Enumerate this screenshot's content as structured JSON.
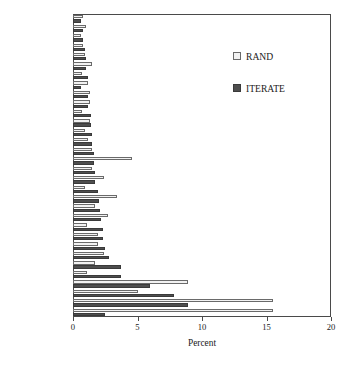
{
  "chart_data": {
    "type": "bar",
    "orientation": "horizontal",
    "title": "",
    "xlabel": "Percent",
    "ylabel": "",
    "xlim": [
      0,
      20
    ],
    "xticks": [
      0,
      5,
      10,
      15,
      20
    ],
    "xticklabels": [
      "0",
      "5",
      "10",
      "15",
      "20"
    ],
    "grid": false,
    "legend_position": "upper right",
    "categories": [
      "Peru",
      "Spain",
      "Jordan",
      "Nigeria",
      "Venezuela",
      "Italy",
      "Angola",
      "Sierra Leone",
      "Russia",
      "India",
      "Tajikistan",
      "Saudi Arabia",
      "Indonesia",
      "Bosnia",
      "Philippines",
      "Greece",
      "Lebanon",
      "France",
      "U.S.",
      "Turkey",
      "Egypt",
      "Afghanistan",
      "Cambodia",
      "Algeria",
      "Yemen",
      "Pakistan",
      "Somalia",
      "U.K.",
      "Iraq",
      "Colombia",
      "Germany",
      "Israel"
    ],
    "series": [
      {
        "name": "RAND",
        "color": "#f2f2f2",
        "values": [
          0.8,
          1.0,
          0.6,
          0.8,
          0.9,
          1.5,
          0.7,
          1.2,
          1.3,
          1.3,
          0.7,
          1.3,
          0.9,
          1.2,
          1.5,
          4.6,
          1.5,
          2.4,
          0.9,
          3.4,
          1.7,
          2.7,
          1.1,
          1.9,
          1.9,
          2.4,
          1.7,
          1.1,
          8.9,
          5.0,
          15.5,
          15.5
        ]
      },
      {
        "name": "ITERATE",
        "color": "#4e4e4e",
        "values": [
          0.6,
          0.8,
          0.8,
          0.9,
          1.0,
          1.0,
          1.2,
          0.6,
          1.2,
          1.2,
          1.4,
          1.4,
          1.5,
          1.5,
          1.6,
          1.6,
          1.7,
          1.7,
          1.9,
          2.0,
          2.1,
          2.2,
          2.3,
          2.3,
          2.5,
          2.8,
          3.7,
          3.7,
          6.0,
          7.8,
          8.9,
          2.5
        ]
      }
    ]
  },
  "legend": {
    "items": [
      {
        "label": "RAND",
        "key": "rand"
      },
      {
        "label": "ITERATE",
        "key": "iter"
      }
    ]
  }
}
